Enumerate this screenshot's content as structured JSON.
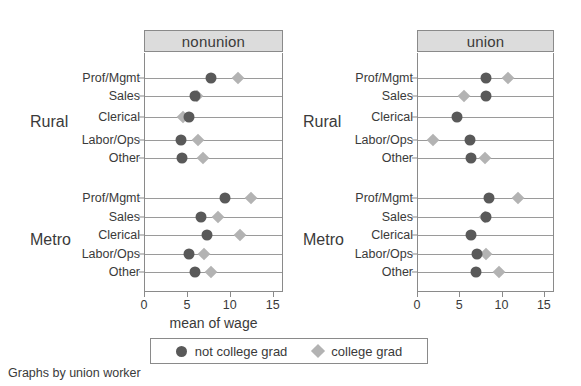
{
  "caption": "Graphs by union worker",
  "axis": {
    "title": "mean of wage",
    "ticks": [
      0,
      5,
      10,
      15
    ],
    "tick_labels": [
      "0",
      "5",
      "10",
      "15"
    ],
    "min": 0,
    "max": 16.2
  },
  "legend": {
    "items": [
      {
        "label": "not college grad",
        "marker": "circle",
        "color": "#595959"
      },
      {
        "label": "college grad",
        "marker": "diamond",
        "color": "#b3b3b3"
      }
    ]
  },
  "panels": [
    {
      "title": "nonunion"
    },
    {
      "title": "union"
    }
  ],
  "groups": [
    {
      "label": "Rural"
    },
    {
      "label": "Metro"
    }
  ],
  "categories": [
    "Prof/Mgmt",
    "Sales",
    "Clerical",
    "Labor/Ops",
    "Other"
  ],
  "chart_data": {
    "type": "scatter",
    "subtype": "dot-plot",
    "title": "",
    "xlabel": "mean of wage",
    "ylabel": "",
    "xlim": [
      0,
      16.2
    ],
    "xticks": [
      0,
      5,
      10,
      15
    ],
    "grid": "horizontal-row-lines",
    "legend_position": "bottom",
    "facet_variable": "union worker",
    "facets": [
      "nonunion",
      "union"
    ],
    "row_group_variable": "area",
    "row_groups": [
      "Rural",
      "Metro"
    ],
    "categories": [
      "Prof/Mgmt",
      "Sales",
      "Clerical",
      "Labor/Ops",
      "Other"
    ],
    "series": [
      {
        "name": "not college grad",
        "marker": "circle",
        "color": "#595959"
      },
      {
        "name": "college grad",
        "marker": "diamond",
        "color": "#b3b3b3"
      }
    ],
    "panels": [
      {
        "facet": "nonunion",
        "groups": [
          {
            "group": "Rural",
            "rows": [
              {
                "category": "Prof/Mgmt",
                "not_college_grad": 7.8,
                "college_grad": 10.9
              },
              {
                "category": "Sales",
                "not_college_grad": 5.9,
                "college_grad": 6.2
              },
              {
                "category": "Clerical",
                "not_college_grad": 5.3,
                "college_grad": 4.5
              },
              {
                "category": "Labor/Ops",
                "not_college_grad": 4.3,
                "college_grad": 6.3
              },
              {
                "category": "Other",
                "not_college_grad": 4.4,
                "college_grad": 6.9
              }
            ]
          },
          {
            "group": "Metro",
            "rows": [
              {
                "category": "Prof/Mgmt",
                "not_college_grad": 9.4,
                "college_grad": 12.5
              },
              {
                "category": "Sales",
                "not_college_grad": 6.6,
                "college_grad": 8.6
              },
              {
                "category": "Clerical",
                "not_college_grad": 7.4,
                "college_grad": 11.2
              },
              {
                "category": "Labor/Ops",
                "not_college_grad": 5.3,
                "college_grad": 7.0
              },
              {
                "category": "Other",
                "not_college_grad": 6.0,
                "college_grad": 7.8
              }
            ]
          }
        ]
      },
      {
        "facet": "union",
        "groups": [
          {
            "group": "Rural",
            "rows": [
              {
                "category": "Prof/Mgmt",
                "not_college_grad": 8.1,
                "college_grad": 10.8
              },
              {
                "category": "Sales",
                "not_college_grad": 8.2,
                "college_grad": 5.6
              },
              {
                "category": "Clerical",
                "not_college_grad": 4.7,
                "college_grad": null
              },
              {
                "category": "Labor/Ops",
                "not_college_grad": 6.3,
                "college_grad": 1.9
              },
              {
                "category": "Other",
                "not_college_grad": 6.4,
                "college_grad": 8.0
              }
            ]
          },
          {
            "group": "Metro",
            "rows": [
              {
                "category": "Prof/Mgmt",
                "not_college_grad": 8.5,
                "college_grad": 11.9
              },
              {
                "category": "Sales",
                "not_college_grad": 8.2,
                "college_grad": 8.0
              },
              {
                "category": "Clerical",
                "not_college_grad": 6.4,
                "college_grad": null
              },
              {
                "category": "Labor/Ops",
                "not_college_grad": 7.1,
                "college_grad": 8.1
              },
              {
                "category": "Other",
                "not_college_grad": 7.0,
                "college_grad": 9.7
              }
            ]
          }
        ]
      }
    ]
  }
}
